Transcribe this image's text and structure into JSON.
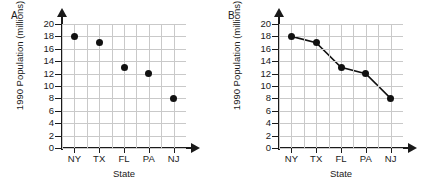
{
  "figure": {
    "panels": [
      {
        "key": "A",
        "label": "A.",
        "name": "panel-a"
      },
      {
        "key": "B",
        "label": "B.",
        "name": "panel-b"
      }
    ]
  },
  "chart_data": [
    {
      "type": "scatter",
      "panel_label": "A.",
      "title": "",
      "xlabel": "State",
      "ylabel": "1990 Population (millions)",
      "categories": [
        "NY",
        "TX",
        "FL",
        "PA",
        "NJ"
      ],
      "values": [
        18,
        17,
        13,
        12,
        8
      ],
      "ylim": [
        0,
        20
      ],
      "yticks": [
        0,
        2,
        4,
        6,
        8,
        10,
        12,
        14,
        16,
        18,
        20
      ],
      "ytick_labels": [
        "0",
        "2",
        "4",
        "6",
        "8",
        "10",
        "12",
        "14",
        "16",
        "18",
        "20"
      ],
      "grid": true,
      "grid_color": "#c9c9c9",
      "marker_color": "#111111",
      "axis_color": "#1a1a1a",
      "legend": null,
      "legend_position": "none",
      "axis_arrows": true
    },
    {
      "type": "line",
      "panel_label": "B.",
      "title": "",
      "xlabel": "State",
      "ylabel": "1990 Population (millions)",
      "categories": [
        "NY",
        "TX",
        "FL",
        "PA",
        "NJ"
      ],
      "values": [
        18,
        17,
        13,
        12,
        8
      ],
      "ylim": [
        0,
        20
      ],
      "yticks": [
        0,
        2,
        4,
        6,
        8,
        10,
        12,
        14,
        16,
        18,
        20
      ],
      "ytick_labels": [
        "0",
        "2",
        "4",
        "6",
        "8",
        "10",
        "12",
        "14",
        "16",
        "18",
        "20"
      ],
      "grid": true,
      "grid_color": "#c9c9c9",
      "marker_color": "#111111",
      "line_color": "#111111",
      "axis_color": "#1a1a1a",
      "legend": null,
      "legend_position": "none",
      "axis_arrows": true
    }
  ],
  "colors": {
    "background": "#ffffff",
    "ink": "#1a1a1a",
    "grid": "#c9c9c9",
    "marker": "#111111"
  }
}
